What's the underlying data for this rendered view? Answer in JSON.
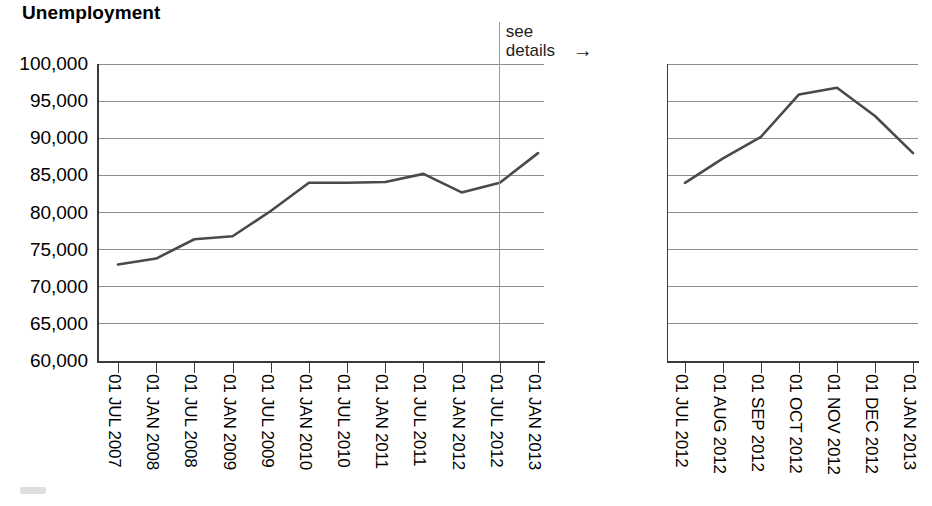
{
  "title": "Unemployment",
  "annotation": {
    "line1": "see",
    "line2": "details",
    "arrow": "→",
    "at_label": "01 JUL 2012"
  },
  "colors": {
    "line": "#4a4a4a",
    "grid": "#8e8e8e",
    "axis": "#3a3a3a",
    "text": "#000000",
    "annotation": "#222222"
  },
  "chart_data": [
    {
      "id": "overview",
      "type": "line",
      "title": "Unemployment",
      "xlabel": "",
      "ylabel": "",
      "ylim": [
        60000,
        100000
      ],
      "ytick_step": 5000,
      "grid": true,
      "legend": "none",
      "ytick_labels": [
        "100,000",
        "95,000",
        "90,000",
        "85,000",
        "80,000",
        "75,000",
        "70,000",
        "65,000",
        "60,000"
      ],
      "ytick_values": [
        100000,
        95000,
        90000,
        85000,
        80000,
        75000,
        70000,
        65000,
        60000
      ],
      "categories": [
        "01 JUL 2007",
        "01 JAN 2008",
        "01 JUL 2008",
        "01 JAN 2009",
        "01 JUL 2009",
        "01 JAN 2010",
        "01 JUL 2010",
        "01 JAN 2011",
        "01 JUL 2011",
        "01 JAN 2012",
        "01 JUL 2012",
        "01 JAN 2013"
      ],
      "values": [
        73000,
        73800,
        76400,
        76800,
        80200,
        84000,
        84000,
        84100,
        85200,
        82700,
        84000,
        88000
      ]
    },
    {
      "id": "detail",
      "type": "line",
      "title": "",
      "xlabel": "",
      "ylabel": "",
      "ylim": [
        60000,
        100000
      ],
      "ytick_step": 5000,
      "grid": true,
      "legend": "none",
      "ytick_labels": [],
      "ytick_values": [
        100000,
        95000,
        90000,
        85000,
        80000,
        75000,
        70000,
        65000,
        60000
      ],
      "categories": [
        "01 JUL 2012",
        "01 AUG 2012",
        "01 SEP 2012",
        "01 OCT 2012",
        "01 NOV 2012",
        "01 DEC 2012",
        "01 JAN 2013"
      ],
      "values": [
        84000,
        87300,
        90200,
        95900,
        96800,
        93000,
        88000
      ]
    }
  ]
}
